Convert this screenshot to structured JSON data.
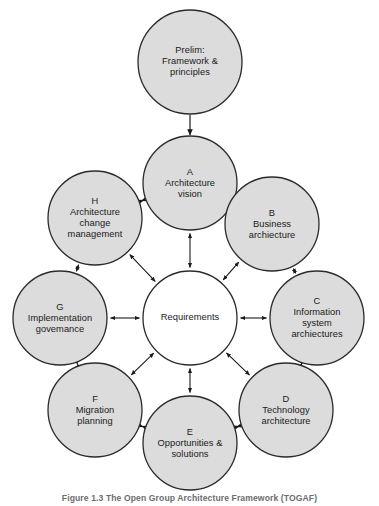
{
  "figure": {
    "caption": "Figure 1.3 The Open Group Architecture Framework (TOGAF)",
    "colors": {
      "circle_fill": "#dcdcdc",
      "circle_stroke": "#2b2b2b",
      "center_fill": "#ffffff",
      "arrow": "#1a1a1a",
      "text": "#1a1a1a",
      "caption_text": "#6d6d6d",
      "background": "#ffffff"
    }
  },
  "nodes": {
    "prelim": {
      "id": "prelim",
      "letter": "",
      "label": "Prelim:\nFramework &\nprinciples",
      "cx": 190,
      "cy": 62,
      "r": 52,
      "filled": true
    },
    "center": {
      "id": "center",
      "letter": "",
      "label": "Requirements",
      "cx": 190,
      "cy": 318,
      "r": 47,
      "filled": false
    },
    "a": {
      "id": "a",
      "letter": "A",
      "label": "A\nArchitecture\nvision",
      "cx": 190,
      "cy": 183,
      "r": 47,
      "filled": true
    },
    "b": {
      "id": "b",
      "letter": "B",
      "label": "B\nBusiness\narchiecture",
      "cx": 272,
      "cy": 224,
      "r": 47,
      "filled": true
    },
    "c": {
      "id": "c",
      "letter": "C",
      "label": "C\nInformation\nsystem\narchiectures",
      "cx": 317,
      "cy": 318,
      "r": 47,
      "filled": true
    },
    "d": {
      "id": "d",
      "letter": "D",
      "label": "D\nTechnology\narchitecture",
      "cx": 286,
      "cy": 410,
      "r": 47,
      "filled": true
    },
    "e": {
      "id": "e",
      "letter": "E",
      "label": "E\nOpportunities &\nsolutions",
      "cx": 190,
      "cy": 443,
      "r": 47,
      "filled": true
    },
    "f": {
      "id": "f",
      "letter": "F",
      "label": "F\nMigration\nplanning",
      "cx": 95,
      "cy": 410,
      "r": 47,
      "filled": true
    },
    "g": {
      "id": "g",
      "letter": "G",
      "label": "G\nImplementation\ngovemance",
      "cx": 60,
      "cy": 318,
      "r": 47,
      "filled": true
    },
    "h": {
      "id": "h",
      "letter": "H",
      "label": "H\nArchitecture\nchange\nmanagement",
      "cx": 95,
      "cy": 218,
      "r": 47,
      "filled": true
    }
  },
  "connections": {
    "prelim_to_a": {
      "from": "prelim",
      "to": "a",
      "style": "single-arrow",
      "direction": "down"
    },
    "spokes": [
      {
        "from": "center",
        "to": "a",
        "style": "double-arrow"
      },
      {
        "from": "center",
        "to": "b",
        "style": "double-arrow"
      },
      {
        "from": "center",
        "to": "c",
        "style": "double-arrow"
      },
      {
        "from": "center",
        "to": "d",
        "style": "double-arrow"
      },
      {
        "from": "center",
        "to": "e",
        "style": "double-arrow"
      },
      {
        "from": "center",
        "to": "f",
        "style": "double-arrow"
      },
      {
        "from": "center",
        "to": "g",
        "style": "double-arrow"
      },
      {
        "from": "center",
        "to": "h",
        "style": "double-arrow"
      }
    ],
    "ring": [
      {
        "from": "a",
        "to": "b",
        "style": "double-arrow"
      },
      {
        "from": "b",
        "to": "c",
        "style": "double-arrow"
      },
      {
        "from": "c",
        "to": "d",
        "style": "double-arrow"
      },
      {
        "from": "d",
        "to": "e",
        "style": "double-arrow"
      },
      {
        "from": "e",
        "to": "f",
        "style": "double-arrow"
      },
      {
        "from": "f",
        "to": "g",
        "style": "double-arrow"
      },
      {
        "from": "g",
        "to": "h",
        "style": "double-arrow"
      },
      {
        "from": "h",
        "to": "a",
        "style": "double-arrow"
      }
    ]
  }
}
